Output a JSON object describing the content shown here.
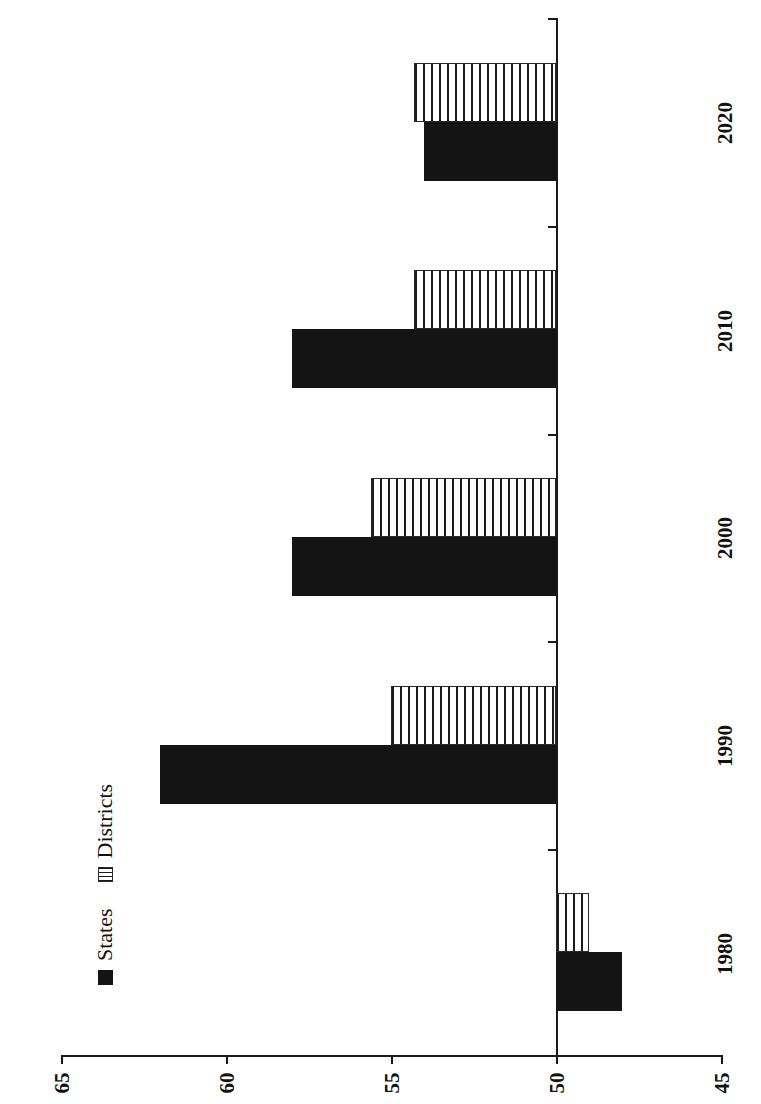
{
  "chart_data": {
    "type": "bar",
    "orientation": "horizontal",
    "title": "",
    "subtitle": "",
    "xlabel": "",
    "ylabel": "",
    "categories": [
      "1980",
      "1990",
      "2000",
      "2010",
      "2020"
    ],
    "series": [
      {
        "name": "States",
        "values": [
          48.0,
          62.0,
          58.0,
          58.0,
          54.0
        ]
      },
      {
        "name": "Districts",
        "values": [
          49.0,
          55.0,
          55.6,
          54.3,
          54.3
        ]
      }
    ],
    "value_axis": {
      "ticks": [
        65,
        60,
        55,
        50,
        45
      ],
      "min": 45,
      "max": 65,
      "reversed": true,
      "baseline": 50
    },
    "grid": false,
    "legend": {
      "position": "left",
      "entries": [
        {
          "label": "States",
          "marker": "filled-square",
          "color": "#141414"
        },
        {
          "label": "Districts",
          "marker": "striped-square",
          "color": "#ffffff"
        }
      ]
    },
    "colors": {
      "states": "#141414",
      "districts": "#ffffff",
      "axis": "#1a1a1a",
      "background": "#ffffff"
    }
  },
  "axis_tick_labels": {
    "v0": "65",
    "v1": "60",
    "v2": "55",
    "v3": "50",
    "v4": "45"
  },
  "category_labels": {
    "c0": "1980",
    "c1": "1990",
    "c2": "2000",
    "c3": "2010",
    "c4": "2020"
  },
  "legend": {
    "states_label": "States",
    "districts_label": "Districts"
  }
}
